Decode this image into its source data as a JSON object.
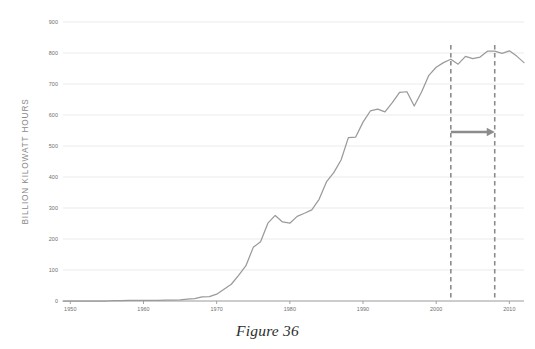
{
  "figure": {
    "caption": "Figure 36"
  },
  "chart_data": {
    "type": "line",
    "title": "",
    "subtitle": "",
    "xlabel": "",
    "ylabel": "BILLION KILOWATT  HOURS",
    "xlim": [
      1949,
      2012
    ],
    "ylim": [
      0,
      900
    ],
    "grid": true,
    "legend": false,
    "legend_position": "none",
    "x_ticks": [
      1950,
      1960,
      1970,
      1980,
      1990,
      2000,
      2010
    ],
    "x_tick_labels": [
      "1950",
      "1960",
      "1970",
      "1980",
      "1990",
      "2000",
      "2010"
    ],
    "y_ticks": [
      0,
      100,
      200,
      300,
      400,
      500,
      600,
      700,
      800,
      900
    ],
    "y_tick_labels": [
      "0",
      "100",
      "200",
      "300",
      "400",
      "500",
      "600",
      "700",
      "800",
      "900"
    ],
    "line_color": "#9a9a9a",
    "grid_color": "#e6e6e6",
    "axis_color": "#9a9a9a",
    "annotation_color": "#8c8c8c",
    "series": [
      {
        "name": "Nuclear electricity generation",
        "color": "#9a9a9a",
        "x": [
          1949,
          1950,
          1951,
          1952,
          1953,
          1954,
          1955,
          1956,
          1957,
          1958,
          1959,
          1960,
          1961,
          1962,
          1963,
          1964,
          1965,
          1966,
          1967,
          1968,
          1969,
          1970,
          1971,
          1972,
          1973,
          1974,
          1975,
          1976,
          1977,
          1978,
          1979,
          1980,
          1981,
          1982,
          1983,
          1984,
          1985,
          1986,
          1987,
          1988,
          1989,
          1990,
          1991,
          1992,
          1993,
          1994,
          1995,
          1996,
          1997,
          1998,
          1999,
          2000,
          2001,
          2002,
          2003,
          2004,
          2005,
          2006,
          2007,
          2008,
          2009,
          2010,
          2011,
          2012
        ],
        "values": [
          0,
          0,
          0,
          0,
          0,
          0,
          0,
          1,
          1,
          2,
          2,
          2,
          2,
          2,
          3,
          3,
          4,
          6,
          8,
          13,
          14,
          22,
          38,
          54,
          83,
          114,
          173,
          191,
          251,
          276,
          255,
          251,
          273,
          283,
          294,
          328,
          384,
          414,
          455,
          527,
          529,
          577,
          613,
          619,
          610,
          640,
          673,
          675,
          629,
          674,
          728,
          754,
          769,
          780,
          764,
          789,
          782,
          787,
          806,
          806,
          799,
          807,
          790,
          769
        ]
      }
    ],
    "annotations": [
      {
        "type": "vline",
        "name": "marker-start",
        "x": 2002,
        "style": "dashed",
        "color": "#8c8c8c",
        "label": ""
      },
      {
        "type": "vline",
        "name": "marker-end",
        "x": 2008,
        "style": "dashed",
        "color": "#8c8c8c",
        "label": ""
      },
      {
        "type": "arrow",
        "name": "span-arrow",
        "x_start": 2002,
        "x_end": 2008,
        "y": 545,
        "direction": "right",
        "color": "#8c8c8c",
        "label": ""
      }
    ]
  }
}
